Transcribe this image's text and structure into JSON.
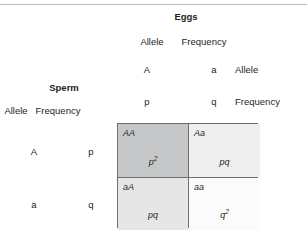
{
  "figure": {
    "name": "hardy-weinberg-punnett-square",
    "colors": {
      "text": "#231f20",
      "grid_line": "#6d6e70",
      "top_rule": "#b9bbbd",
      "cell_dark": "#c6c7c9",
      "cell_light": "#ebebeb",
      "cell_lighter": "#e3e3e3",
      "cell_white": "#fbfbfb"
    }
  },
  "eggs": {
    "title": "Eggs",
    "allele_header": "Allele",
    "frequency_header": "Frequency",
    "columns": [
      {
        "allele": "A",
        "frequency": "p"
      },
      {
        "allele": "a",
        "frequency": "q"
      }
    ]
  },
  "sperm": {
    "title": "Sperm",
    "allele_header": "Allele",
    "frequency_header": "Frequency",
    "rows": [
      {
        "allele": "A",
        "frequency": "p"
      },
      {
        "allele": "a",
        "frequency": "q"
      }
    ]
  },
  "row_legend": {
    "allele": "Allele",
    "frequency": "Frequency"
  },
  "punnett": {
    "cells": [
      {
        "genotype": "AA",
        "frequency": "p",
        "exponent": "2",
        "shade": "#c6c7c9"
      },
      {
        "genotype": "Aa",
        "frequency": "pq",
        "exponent": "",
        "shade": "#efefef"
      },
      {
        "genotype": "aA",
        "frequency": "pq",
        "exponent": "",
        "shade": "#e6e6e6"
      },
      {
        "genotype": "aa",
        "frequency": "q",
        "exponent": "2",
        "shade": "#fbfbfb"
      }
    ]
  }
}
